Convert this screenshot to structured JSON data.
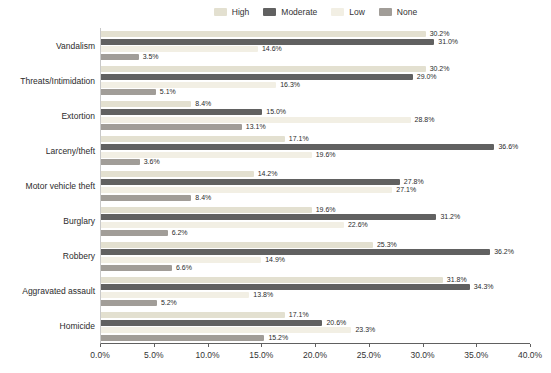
{
  "chart_data": {
    "type": "bar",
    "orientation": "horizontal",
    "title": "",
    "xlabel": "",
    "ylabel": "",
    "xlim": [
      0,
      40
    ],
    "x_tick_labels": [
      "0.0%",
      "5.0%",
      "10.0%",
      "15.0%",
      "20.0%",
      "25.0%",
      "30.0%",
      "35.0%",
      "40.0%"
    ],
    "x_tick_values": [
      0,
      5,
      10,
      15,
      20,
      25,
      30,
      35,
      40
    ],
    "grid": false,
    "legend_position": "top",
    "value_label_suffix": "%",
    "categories": [
      "Vandalism",
      "Threats/Intimidation",
      "Extortion",
      "Larceny/theft",
      "Motor vehicle theft",
      "Burglary",
      "Robbery",
      "Aggravated assault",
      "Homicide"
    ],
    "series": [
      {
        "name": "High",
        "color": "#e3e0d0",
        "values": [
          30.2,
          30.2,
          8.4,
          17.1,
          14.2,
          19.6,
          25.3,
          31.8,
          17.1
        ]
      },
      {
        "name": "Moderate",
        "color": "#616161",
        "values": [
          31.0,
          29.0,
          15.0,
          36.6,
          27.8,
          31.2,
          36.2,
          34.3,
          20.6
        ]
      },
      {
        "name": "Low",
        "color": "#f2efe4",
        "values": [
          14.6,
          16.3,
          28.8,
          19.6,
          27.1,
          22.6,
          14.9,
          13.8,
          23.3
        ]
      },
      {
        "name": "None",
        "color": "#a19d98",
        "values": [
          3.5,
          5.1,
          13.1,
          3.6,
          8.4,
          6.2,
          6.6,
          5.2,
          15.2
        ]
      }
    ],
    "colors": {
      "axis_line": "#606060",
      "y_axis_line": "#c9c9c9",
      "text": "#2b2b2b"
    }
  }
}
